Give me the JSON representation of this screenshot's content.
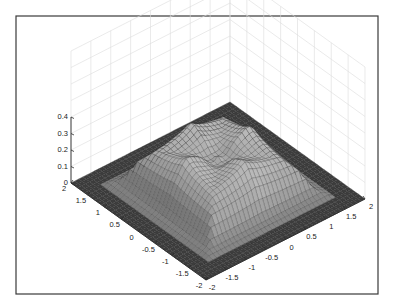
{
  "chart_data": {
    "type": "surface3d",
    "title": "",
    "xlabel": "",
    "ylabel": "",
    "zlabel": "",
    "x_range": [
      -2,
      2
    ],
    "y_range": [
      -2,
      2
    ],
    "z_range": [
      0,
      0.4
    ],
    "x_ticks": [
      "-2",
      "-1.5",
      "-1",
      "-0.5",
      "0",
      "0.5",
      "1",
      "1.5",
      "2"
    ],
    "y_ticks": [
      "-2",
      "-1.5",
      "-1",
      "-0.5",
      "0",
      "0.5",
      "1",
      "1.5",
      "2"
    ],
    "z_ticks": [
      "0",
      "0.1",
      "0.2",
      "0.3",
      "0.4"
    ],
    "grid": true,
    "colormap": "gray",
    "peak_z": 0.3,
    "plateau_z": 0.22,
    "floor_extent": [
      -1.6,
      1.6
    ]
  },
  "axes": {
    "left_axis_labels": [
      "2",
      "1.5",
      "1",
      "0.5",
      "0",
      "-0.5",
      "-1",
      "-1.5",
      "-2"
    ],
    "right_axis_labels": [
      "-2",
      "-1.5",
      "-1",
      "-0.5",
      "0",
      "0.5",
      "1",
      "1.5",
      "2"
    ],
    "z_axis_labels": [
      "0",
      "0.1",
      "0.2",
      "0.3",
      "0.4"
    ]
  },
  "colors": {
    "floor": "#3c3c3c",
    "surface_light": "#9a9a9a",
    "surface_dark": "#3a3a3a",
    "grid": "#dcdcdc",
    "frame": "#3a3a3a"
  }
}
